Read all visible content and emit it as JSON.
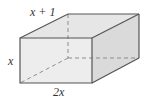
{
  "diagram": {
    "type": "rectangular-prism",
    "labels": {
      "depth": "x + 1",
      "height": "x",
      "width": "2x"
    },
    "colors": {
      "edge": "#555555",
      "front_face": "#ececec",
      "top_face": "#e4e4e4",
      "side_face": "#dcdcdc",
      "hidden_edge": "#777777"
    }
  }
}
